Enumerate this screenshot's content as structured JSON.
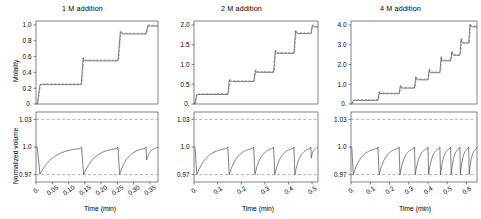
{
  "figure": {
    "panel_count": 3,
    "shared_xlabel": "Time (min)",
    "ylabel_top": "Molality",
    "ylabel_bottom": "Normalized volume",
    "line_color": "#555555",
    "dash_color": "#9a9a9a",
    "axis_color": "#4d4d4d",
    "background": "#ffffff"
  },
  "chart_data": [
    {
      "type": "line",
      "title": "1 M addition",
      "xlabel": "Time (min)",
      "ylabel": "Molality",
      "xlim": [
        0,
        0.375
      ],
      "ylim": [
        0,
        1.05
      ],
      "xticks": [
        "0.",
        "0.05",
        "0.10",
        "0.15",
        "0.20",
        "0.25",
        "0.30",
        "0.35"
      ],
      "xtickvals": [
        0,
        0.05,
        0.1,
        0.15,
        0.2,
        0.25,
        0.3,
        0.35
      ],
      "yticks": [
        "0.",
        "0.2",
        "0.4",
        "0.6",
        "0.8",
        "1.0"
      ],
      "ytickvals": [
        0,
        0.2,
        0.4,
        0.6,
        0.8,
        1.0
      ],
      "grid": false,
      "legend": "none",
      "series": [
        {
          "name": "molality-solid",
          "style": "solid",
          "steps": [
            {
              "t_rise": 0.004,
              "t_settle": 0.022,
              "level": 0.245,
              "overshoot": 0.0
            },
            {
              "t_rise": 0.139,
              "t_settle": 0.152,
              "level": 0.545,
              "overshoot": 0.035
            },
            {
              "t_rise": 0.252,
              "t_settle": 0.268,
              "level": 0.885,
              "overshoot": 0.03
            },
            {
              "t_rise": 0.338,
              "t_settle": 0.352,
              "level": 0.985,
              "overshoot": 0.015
            }
          ]
        },
        {
          "name": "molality-dashed-model",
          "style": "dashed",
          "note": "near-coincident model overlay"
        }
      ]
    },
    {
      "type": "line",
      "title": "2 M addition",
      "xlabel": "Time (min)",
      "ylabel": "Molality",
      "xlim": [
        0,
        0.525
      ],
      "ylim": [
        0,
        2.1
      ],
      "xticks": [
        "0.",
        "0.1",
        "0.2",
        "0.3",
        "0.4",
        "0.5"
      ],
      "xtickvals": [
        0,
        0.1,
        0.2,
        0.3,
        0.4,
        0.5
      ],
      "yticks": [
        "0.",
        "0.5",
        "1.0",
        "1.5",
        "2.0"
      ],
      "ytickvals": [
        0,
        0.5,
        1.0,
        1.5,
        2.0
      ],
      "grid": false,
      "legend": "none",
      "series": [
        {
          "name": "molality-solid",
          "style": "solid",
          "steps": [
            {
              "t_rise": 0.004,
              "t_settle": 0.02,
              "level": 0.24,
              "overshoot": 0.0
            },
            {
              "t_rise": 0.143,
              "t_settle": 0.158,
              "level": 0.565,
              "overshoot": 0.05
            },
            {
              "t_rise": 0.253,
              "t_settle": 0.268,
              "level": 0.8,
              "overshoot": 0.05
            },
            {
              "t_rise": 0.337,
              "t_settle": 0.352,
              "level": 1.28,
              "overshoot": 0.07
            },
            {
              "t_rise": 0.423,
              "t_settle": 0.438,
              "level": 1.78,
              "overshoot": 0.07
            },
            {
              "t_rise": 0.495,
              "t_settle": 0.508,
              "level": 1.95,
              "overshoot": 0.04
            }
          ]
        },
        {
          "name": "molality-dashed-model",
          "style": "dashed",
          "note": "near-coincident model overlay"
        }
      ]
    },
    {
      "type": "line",
      "title": "4 M addition",
      "xlabel": "Time (min)",
      "ylabel": "Molality",
      "xlim": [
        0,
        0.655
      ],
      "ylim": [
        0,
        4.2
      ],
      "xticks": [
        "0.",
        "0.1",
        "0.2",
        "0.3",
        "0.4",
        "0.5",
        "0.6"
      ],
      "xtickvals": [
        0,
        0.1,
        0.2,
        0.3,
        0.4,
        0.5,
        0.6
      ],
      "yticks": [
        "0.",
        "1.0",
        "2.0",
        "3.0",
        "4.0"
      ],
      "ytickvals": [
        0,
        1.0,
        2.0,
        3.0,
        4.0
      ],
      "grid": false,
      "legend": "none",
      "series": [
        {
          "name": "molality-solid",
          "style": "solid",
          "steps": [
            {
              "t_rise": 0.004,
              "t_settle": 0.022,
              "level": 0.18,
              "overshoot": 0.0
            },
            {
              "t_rise": 0.14,
              "t_settle": 0.155,
              "level": 0.52,
              "overshoot": 0.1
            },
            {
              "t_rise": 0.25,
              "t_settle": 0.264,
              "level": 0.8,
              "overshoot": 0.12
            },
            {
              "t_rise": 0.33,
              "t_settle": 0.344,
              "level": 1.22,
              "overshoot": 0.14
            },
            {
              "t_rise": 0.4,
              "t_settle": 0.414,
              "level": 1.58,
              "overshoot": 0.16
            },
            {
              "t_rise": 0.462,
              "t_settle": 0.476,
              "level": 2.18,
              "overshoot": 0.18
            },
            {
              "t_rise": 0.518,
              "t_settle": 0.532,
              "level": 2.46,
              "overshoot": 0.18
            },
            {
              "t_rise": 0.566,
              "t_settle": 0.58,
              "level": 3.08,
              "overshoot": 0.2
            },
            {
              "t_rise": 0.612,
              "t_settle": 0.626,
              "level": 3.9,
              "overshoot": 0.12
            }
          ]
        },
        {
          "name": "molality-dashed-model",
          "style": "dashed",
          "note": "near-coincident model overlay"
        }
      ]
    }
  ],
  "chart_data_volume": [
    {
      "type": "line",
      "panel": "1 M addition",
      "xlabel": "Time (min)",
      "ylabel": "Normalized volume",
      "xlim": [
        0,
        0.375
      ],
      "ylim": [
        0.962,
        1.038
      ],
      "yticks": [
        "0.97",
        "1.0",
        "1.03"
      ],
      "ytickvals": [
        0.97,
        1.0,
        1.03
      ],
      "reference_lines": [
        1.03,
        0.97
      ],
      "reference_style": "dashed",
      "sawtooth_cycles": [
        {
          "drop_t": 0.004,
          "min": 0.9705,
          "recover_t": 0.136,
          "peak": 1.0
        },
        {
          "drop_t": 0.14,
          "min": 0.97,
          "recover_t": 0.248,
          "peak": 1.0
        },
        {
          "drop_t": 0.252,
          "min": 0.97,
          "recover_t": 0.334,
          "peak": 1.0
        },
        {
          "drop_t": 0.338,
          "min": 0.986,
          "recover_t": 0.372,
          "peak": 1.0
        }
      ]
    },
    {
      "type": "line",
      "panel": "2 M addition",
      "xlabel": "Time (min)",
      "ylabel": "Normalized volume",
      "xlim": [
        0,
        0.525
      ],
      "ylim": [
        0.962,
        1.038
      ],
      "yticks": [
        "0.97",
        "1.0",
        "1.03"
      ],
      "ytickvals": [
        0.97,
        1.0,
        1.03
      ],
      "reference_lines": [
        1.03,
        0.97
      ],
      "reference_style": "dashed",
      "sawtooth_cycles": [
        {
          "drop_t": 0.004,
          "min": 0.97,
          "recover_t": 0.138,
          "peak": 1.0
        },
        {
          "drop_t": 0.143,
          "min": 0.97,
          "recover_t": 0.248,
          "peak": 1.0
        },
        {
          "drop_t": 0.253,
          "min": 0.97,
          "recover_t": 0.332,
          "peak": 1.0
        },
        {
          "drop_t": 0.337,
          "min": 0.97,
          "recover_t": 0.418,
          "peak": 1.0
        },
        {
          "drop_t": 0.423,
          "min": 0.97,
          "recover_t": 0.49,
          "peak": 1.0
        },
        {
          "drop_t": 0.495,
          "min": 0.988,
          "recover_t": 0.522,
          "peak": 1.0
        }
      ]
    },
    {
      "type": "line",
      "panel": "4 M addition",
      "xlabel": "Time (min)",
      "ylabel": "Normalized volume",
      "xlim": [
        0,
        0.655
      ],
      "ylim": [
        0.962,
        1.038
      ],
      "yticks": [
        "0.97",
        "1.0",
        "1.03"
      ],
      "ytickvals": [
        0.97,
        1.0,
        1.03
      ],
      "reference_lines": [
        1.03,
        0.97
      ],
      "reference_style": "dashed",
      "sawtooth_cycles": [
        {
          "drop_t": 0.004,
          "min": 0.97,
          "recover_t": 0.136,
          "peak": 1.0
        },
        {
          "drop_t": 0.14,
          "min": 0.97,
          "recover_t": 0.246,
          "peak": 1.0
        },
        {
          "drop_t": 0.25,
          "min": 0.97,
          "recover_t": 0.326,
          "peak": 1.0
        },
        {
          "drop_t": 0.33,
          "min": 0.97,
          "recover_t": 0.396,
          "peak": 1.0
        },
        {
          "drop_t": 0.4,
          "min": 0.97,
          "recover_t": 0.458,
          "peak": 1.0
        },
        {
          "drop_t": 0.462,
          "min": 0.97,
          "recover_t": 0.514,
          "peak": 1.0
        },
        {
          "drop_t": 0.518,
          "min": 0.97,
          "recover_t": 0.562,
          "peak": 1.0
        },
        {
          "drop_t": 0.566,
          "min": 0.97,
          "recover_t": 0.608,
          "peak": 1.0
        },
        {
          "drop_t": 0.612,
          "min": 0.97,
          "recover_t": 0.652,
          "peak": 1.0
        }
      ]
    }
  ]
}
